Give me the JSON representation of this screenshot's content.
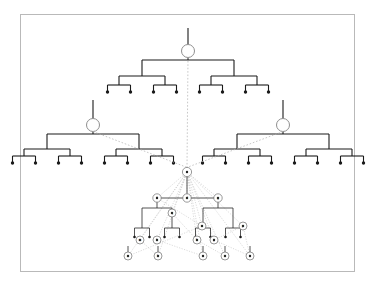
{
  "figure": {
    "title": "",
    "background_color": "#ffffff",
    "frame_color": "#b9b9b9",
    "line_color": "#1a1a1a",
    "dashed_link_color": "#b0b0b0",
    "node_outline_color": "#8f8f8f"
  },
  "diagram": {
    "type": "hierarchical-tree-graph",
    "trees": [
      {
        "id": "top-tree",
        "position": "top-center",
        "root_circle": {
          "cx": 188,
          "cy": 51,
          "r": 6.5
        },
        "stem_top_y": 28,
        "depth": 3,
        "leaf_count": 8,
        "level_y": [
          51,
          60,
          76,
          92
        ],
        "half_span": 46
      },
      {
        "id": "left-tree",
        "position": "middle-left",
        "root_circle": {
          "cx": 93,
          "cy": 125,
          "r": 6.5
        },
        "stem_top_y": 100,
        "depth": 3,
        "leaf_count": 8,
        "level_y": [
          125,
          134,
          149,
          163
        ],
        "half_span": 46
      },
      {
        "id": "right-tree",
        "position": "middle-right",
        "root_circle": {
          "cx": 283,
          "cy": 125,
          "r": 6.5
        },
        "stem_top_y": 100,
        "depth": 3,
        "leaf_count": 8,
        "level_y": [
          125,
          134,
          149,
          163
        ],
        "half_span": 46
      }
    ],
    "central_graph": {
      "apex": {
        "id": "a0",
        "label": "r",
        "cx": 187,
        "cy": 172,
        "r": 4.6
      },
      "levels": [
        {
          "name": "level-1",
          "y": 198,
          "nodes": [
            {
              "id": "b0",
              "label": "f",
              "cx": 157,
              "cy": 198,
              "r": 4.2
            },
            {
              "id": "b1",
              "label": "d",
              "cx": 187,
              "cy": 198,
              "r": 4.2
            },
            {
              "id": "b2",
              "label": "g",
              "cx": 218,
              "cy": 198,
              "r": 4.2
            }
          ]
        },
        {
          "name": "level-2",
          "y": 213,
          "nodes": [
            {
              "id": "c0",
              "label": "q",
              "cx": 172,
              "cy": 213,
              "r": 4.0
            },
            {
              "id": "c1",
              "label": "p",
              "cx": 243,
              "cy": 226,
              "r": 4.0
            }
          ]
        },
        {
          "name": "level-3",
          "y": 228,
          "nodes": [
            {
              "id": "d0",
              "label": "n",
              "cx": 202,
              "cy": 226,
              "r": 4.0
            },
            {
              "id": "d1",
              "label": "m",
              "cx": 140,
              "cy": 240,
              "r": 4.0
            },
            {
              "id": "d2",
              "label": "k",
              "cx": 157,
              "cy": 240,
              "r": 4.0
            },
            {
              "id": "d3",
              "label": "h",
              "cx": 197,
              "cy": 240,
              "r": 4.0
            },
            {
              "id": "d4",
              "label": "j",
              "cx": 214,
              "cy": 240,
              "r": 4.0
            }
          ]
        },
        {
          "name": "level-4",
          "y": 256,
          "nodes": [
            {
              "id": "e0",
              "label": "a",
              "cx": 128,
              "cy": 256,
              "r": 4.0
            },
            {
              "id": "e1",
              "label": "b",
              "cx": 158,
              "cy": 256,
              "r": 4.0
            },
            {
              "id": "e2",
              "label": "c",
              "cx": 203,
              "cy": 256,
              "r": 4.0
            },
            {
              "id": "e3",
              "label": "e",
              "cx": 225,
              "cy": 256,
              "r": 4.0
            },
            {
              "id": "e4",
              "label": "i",
              "cx": 250,
              "cy": 256,
              "r": 4.0
            }
          ]
        }
      ],
      "dashed_fan_from_apex": 9,
      "total_labeled_nodes": 16
    },
    "dashed_connectors": [
      {
        "from": "top-tree-root",
        "to": "central-apex",
        "style": "dotted-vertical"
      },
      {
        "from": "left-tree-root",
        "to": "central-apex",
        "style": "dotted-diagonal"
      },
      {
        "from": "right-tree-root",
        "to": "central-apex",
        "style": "dotted-diagonal"
      }
    ]
  }
}
